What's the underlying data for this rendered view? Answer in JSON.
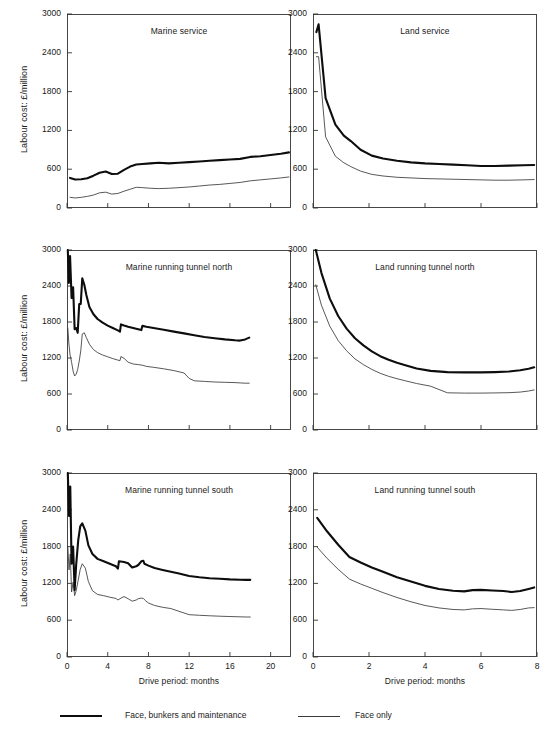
{
  "figure": {
    "y_axis_label": "Labour cost: £/million",
    "x_axis_label": "Drive period: months",
    "legend": [
      {
        "key": "thick",
        "label": "Face, bunkers and maintenance"
      },
      {
        "key": "thin",
        "label": "Face only"
      }
    ],
    "colors": {
      "thick_line": "#0d0d0d",
      "thin_line": "#3a3a3a",
      "axis": "#333333",
      "background": "#ffffff"
    }
  },
  "chart_data": [
    {
      "type": "line",
      "title": "Marine service",
      "xlabel": "Drive period: months",
      "ylabel": "Labour cost: £/million",
      "xlim": [
        0,
        22
      ],
      "ylim": [
        0,
        3000
      ],
      "xticks": [
        0,
        4,
        8,
        12,
        16,
        20
      ],
      "yticks": [
        0,
        600,
        1200,
        1800,
        2400,
        3000
      ],
      "grid": false,
      "legend_position": "figure-bottom",
      "series": [
        {
          "name": "Face, bunkers and maintenance",
          "style": "thick",
          "x": [
            0.3,
            0.8,
            1.4,
            2.0,
            2.6,
            3.2,
            3.8,
            4.4,
            5.0,
            5.6,
            6.2,
            6.8,
            7.4,
            8.2,
            9.0,
            10.0,
            11.0,
            12.0,
            13.0,
            14.0,
            15.0,
            16.0,
            17.0,
            18.0,
            19.0,
            20.0,
            21.0,
            21.8
          ],
          "y": [
            465,
            440,
            445,
            460,
            500,
            545,
            565,
            525,
            530,
            590,
            640,
            672,
            680,
            690,
            700,
            690,
            700,
            710,
            720,
            730,
            740,
            750,
            760,
            790,
            800,
            820,
            840,
            860
          ]
        },
        {
          "name": "Face only",
          "style": "thin",
          "x": [
            0.3,
            0.8,
            1.4,
            2.0,
            2.6,
            3.2,
            3.8,
            4.4,
            5.0,
            5.6,
            6.2,
            6.8,
            7.4,
            8.2,
            9.0,
            10.0,
            11.0,
            12.0,
            13.0,
            14.0,
            15.0,
            16.0,
            17.0,
            18.0,
            19.0,
            20.0,
            21.0,
            21.8
          ],
          "y": [
            165,
            155,
            165,
            180,
            200,
            235,
            245,
            215,
            225,
            260,
            290,
            320,
            315,
            305,
            300,
            305,
            315,
            325,
            340,
            355,
            365,
            380,
            395,
            420,
            435,
            450,
            465,
            480
          ]
        }
      ]
    },
    {
      "type": "line",
      "title": "Land service",
      "xlabel": "Drive period: months",
      "ylabel": "Labour cost: £/million",
      "xlim": [
        0,
        8
      ],
      "ylim": [
        0,
        3000
      ],
      "xticks": [
        0,
        2,
        4,
        6,
        8
      ],
      "yticks": [
        0,
        600,
        1200,
        1800,
        2400,
        3000
      ],
      "grid": false,
      "legend_position": "figure-bottom",
      "series": [
        {
          "name": "Face, bunkers and maintenance",
          "style": "thick",
          "x": [
            0.12,
            0.2,
            0.45,
            0.8,
            1.1,
            1.35,
            1.7,
            2.1,
            2.5,
            3.0,
            3.5,
            4.0,
            4.5,
            5.0,
            5.5,
            6.0,
            6.5,
            7.0,
            7.5,
            7.9
          ],
          "y": [
            2720,
            2840,
            1700,
            1290,
            1120,
            1035,
            900,
            810,
            765,
            730,
            705,
            690,
            680,
            670,
            660,
            650,
            650,
            655,
            660,
            665
          ]
        },
        {
          "name": "Face only",
          "style": "thin",
          "x": [
            0.12,
            0.2,
            0.45,
            0.8,
            1.1,
            1.35,
            1.7,
            2.1,
            2.5,
            3.0,
            3.5,
            4.0,
            4.5,
            5.0,
            5.5,
            6.0,
            6.5,
            7.0,
            7.5,
            7.9
          ],
          "y": [
            2340,
            2340,
            1100,
            800,
            700,
            640,
            570,
            520,
            495,
            475,
            465,
            455,
            450,
            445,
            440,
            435,
            430,
            430,
            435,
            440
          ]
        }
      ]
    },
    {
      "type": "line",
      "title": "Marine running tunnel north",
      "xlabel": "Drive period: months",
      "ylabel": "Labour cost: £/million",
      "xlim": [
        0,
        22
      ],
      "ylim": [
        0,
        3000
      ],
      "xticks": [
        0,
        4,
        8,
        12,
        16,
        20
      ],
      "yticks": [
        0,
        600,
        1200,
        1800,
        2400,
        3000
      ],
      "grid": false,
      "legend_position": "figure-bottom",
      "series": [
        {
          "name": "Face, bunkers and maintenance",
          "style": "thick",
          "x": [
            0.08,
            0.18,
            0.3,
            0.45,
            0.6,
            0.75,
            0.9,
            1.05,
            1.2,
            1.35,
            1.5,
            1.7,
            1.9,
            2.2,
            2.6,
            3.0,
            3.5,
            4.0,
            4.5,
            5.0,
            5.2,
            5.3,
            5.6,
            6.0,
            6.5,
            7.0,
            7.3,
            7.4,
            7.8,
            8.5,
            9.5,
            10.5,
            11.5,
            12.5,
            13.5,
            14.5,
            15.5,
            16.5,
            17.0,
            17.5,
            17.9
          ],
          "y": [
            3000,
            2450,
            2900,
            2200,
            2380,
            1680,
            1700,
            1620,
            2100,
            2100,
            2530,
            2420,
            2250,
            2050,
            1930,
            1850,
            1790,
            1740,
            1700,
            1660,
            1640,
            1760,
            1740,
            1720,
            1700,
            1680,
            1665,
            1735,
            1720,
            1700,
            1670,
            1640,
            1610,
            1580,
            1550,
            1530,
            1510,
            1495,
            1490,
            1510,
            1540
          ]
        },
        {
          "name": "Face only",
          "style": "thin",
          "x": [
            0.08,
            0.18,
            0.3,
            0.45,
            0.6,
            0.75,
            0.9,
            1.05,
            1.2,
            1.35,
            1.5,
            1.7,
            1.9,
            2.2,
            2.6,
            3.0,
            3.5,
            4.0,
            4.5,
            5.0,
            5.2,
            5.3,
            5.6,
            6.0,
            6.5,
            7.0,
            7.4,
            7.8,
            8.5,
            9.5,
            10.5,
            11.5,
            12.0,
            12.5,
            13.5,
            14.5,
            15.5,
            16.5,
            17.0,
            17.5,
            17.9
          ],
          "y": [
            1700,
            1450,
            1250,
            1130,
            980,
            900,
            930,
            1010,
            1150,
            1320,
            1600,
            1620,
            1540,
            1430,
            1340,
            1290,
            1250,
            1220,
            1190,
            1165,
            1155,
            1225,
            1195,
            1130,
            1100,
            1090,
            1080,
            1060,
            1045,
            1020,
            990,
            950,
            860,
            820,
            810,
            800,
            795,
            790,
            785,
            780,
            780
          ]
        }
      ]
    },
    {
      "type": "line",
      "title": "Land running tunnel north",
      "xlabel": "Drive period: months",
      "ylabel": "Labour cost: £/million",
      "xlim": [
        0,
        8
      ],
      "ylim": [
        0,
        3000
      ],
      "xticks": [
        0,
        2,
        4,
        6,
        8
      ],
      "yticks": [
        0,
        600,
        1200,
        1800,
        2400,
        3000
      ],
      "grid": false,
      "legend_position": "figure-bottom",
      "series": [
        {
          "name": "Face, bunkers and maintenance",
          "style": "thick",
          "x": [
            0.1,
            0.3,
            0.6,
            0.9,
            1.2,
            1.5,
            1.8,
            2.1,
            2.4,
            2.7,
            3.0,
            3.3,
            3.7,
            4.2,
            4.8,
            5.4,
            6.0,
            6.5,
            7.0,
            7.4,
            7.7,
            7.9
          ],
          "y": [
            3000,
            2620,
            2190,
            1900,
            1690,
            1530,
            1410,
            1310,
            1230,
            1170,
            1120,
            1080,
            1025,
            985,
            965,
            960,
            960,
            965,
            975,
            995,
            1020,
            1045
          ]
        },
        {
          "name": "Face only",
          "style": "thin",
          "x": [
            0.1,
            0.3,
            0.6,
            0.9,
            1.2,
            1.5,
            1.8,
            2.1,
            2.4,
            2.7,
            3.0,
            3.3,
            3.7,
            4.2,
            4.8,
            5.4,
            6.0,
            6.5,
            7.0,
            7.4,
            7.7,
            7.9
          ],
          "y": [
            2420,
            2080,
            1730,
            1490,
            1320,
            1185,
            1090,
            1010,
            945,
            895,
            855,
            820,
            775,
            730,
            620,
            615,
            615,
            618,
            622,
            632,
            650,
            668
          ]
        }
      ]
    },
    {
      "type": "line",
      "title": "Marine running tunnel south",
      "xlabel": "Drive period: months",
      "ylabel": "Labour cost: £/million",
      "xlim": [
        0,
        22
      ],
      "ylim": [
        0,
        3000
      ],
      "xticks": [
        0,
        4,
        8,
        12,
        16,
        20
      ],
      "yticks": [
        0,
        600,
        1200,
        1800,
        2400,
        3000
      ],
      "grid": false,
      "legend_position": "figure-bottom",
      "series": [
        {
          "name": "Face, bunkers and maintenance",
          "style": "thick",
          "x": [
            0.08,
            0.2,
            0.32,
            0.45,
            0.6,
            0.75,
            0.9,
            1.1,
            1.3,
            1.5,
            1.8,
            2.1,
            2.5,
            3.0,
            3.6,
            4.2,
            4.8,
            5.0,
            5.1,
            5.6,
            6.0,
            6.4,
            6.8,
            7.0,
            7.3,
            7.5,
            7.6,
            8.0,
            8.6,
            9.4,
            10.2,
            11.0,
            12.0,
            13.0,
            14.0,
            15.0,
            16.0,
            17.0,
            17.6,
            18.0
          ],
          "y": [
            3000,
            2300,
            2780,
            1520,
            1800,
            1090,
            1500,
            1900,
            2130,
            2180,
            2060,
            1820,
            1680,
            1600,
            1560,
            1520,
            1480,
            1440,
            1560,
            1550,
            1530,
            1460,
            1480,
            1500,
            1560,
            1570,
            1520,
            1490,
            1450,
            1420,
            1390,
            1360,
            1320,
            1300,
            1285,
            1275,
            1265,
            1260,
            1258,
            1258
          ]
        },
        {
          "name": "Face only",
          "style": "thin",
          "x": [
            0.08,
            0.2,
            0.32,
            0.45,
            0.6,
            0.75,
            0.9,
            1.1,
            1.3,
            1.5,
            1.8,
            2.1,
            2.5,
            3.0,
            3.6,
            4.2,
            4.8,
            5.0,
            5.3,
            5.6,
            6.0,
            6.4,
            6.8,
            7.0,
            7.3,
            7.5,
            7.7,
            8.0,
            8.6,
            9.4,
            10.2,
            11.0,
            12.0,
            13.0,
            14.0,
            15.0,
            16.0,
            17.0,
            17.6,
            18.0
          ],
          "y": [
            1800,
            1420,
            1680,
            1060,
            1220,
            1000,
            1080,
            1250,
            1430,
            1520,
            1450,
            1230,
            1080,
            1020,
            1000,
            975,
            955,
            930,
            960,
            985,
            950,
            910,
            930,
            950,
            960,
            955,
            920,
            880,
            840,
            810,
            790,
            745,
            690,
            680,
            672,
            665,
            660,
            655,
            652,
            652
          ]
        }
      ]
    },
    {
      "type": "line",
      "title": "Land running tunnel south",
      "xlabel": "Drive period: months",
      "ylabel": "Labour cost: £/million",
      "xlim": [
        0,
        8
      ],
      "ylim": [
        0,
        3000
      ],
      "xticks": [
        0,
        2,
        4,
        6,
        8
      ],
      "yticks": [
        0,
        600,
        1200,
        1800,
        2400,
        3000
      ],
      "grid": false,
      "legend_position": "figure-bottom",
      "series": [
        {
          "name": "Face, bunkers and maintenance",
          "style": "thick",
          "x": [
            0.15,
            0.5,
            0.9,
            1.3,
            1.7,
            2.1,
            2.5,
            3.0,
            3.5,
            4.0,
            4.5,
            5.0,
            5.4,
            5.7,
            6.0,
            6.4,
            6.8,
            7.1,
            7.4,
            7.7,
            7.9
          ],
          "y": [
            2270,
            2050,
            1830,
            1630,
            1540,
            1460,
            1390,
            1300,
            1230,
            1160,
            1110,
            1080,
            1070,
            1090,
            1095,
            1085,
            1075,
            1060,
            1075,
            1110,
            1135
          ]
        },
        {
          "name": "Face only",
          "style": "thin",
          "x": [
            0.15,
            0.5,
            0.9,
            1.3,
            1.7,
            2.1,
            2.5,
            3.0,
            3.5,
            4.0,
            4.5,
            5.0,
            5.4,
            5.7,
            6.0,
            6.4,
            6.8,
            7.1,
            7.4,
            7.7,
            7.9
          ],
          "y": [
            1790,
            1610,
            1430,
            1270,
            1190,
            1120,
            1050,
            970,
            900,
            840,
            800,
            775,
            768,
            785,
            790,
            778,
            768,
            760,
            775,
            800,
            805
          ]
        }
      ]
    }
  ]
}
